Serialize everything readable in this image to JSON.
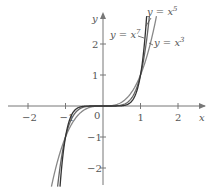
{
  "chart_data": {
    "type": "line",
    "title": "",
    "xlabel": "x",
    "ylabel": "y",
    "xlim": [
      -2.7,
      2.7
    ],
    "ylim": [
      -2.8,
      3.3
    ],
    "xticks": [
      -2,
      -1,
      1,
      2
    ],
    "yticks": [
      -2,
      -1,
      1,
      2
    ],
    "xtick_labels": [
      "−2",
      "−1",
      "1",
      "2"
    ],
    "ytick_labels": [
      "−2",
      "−1",
      "1",
      "2"
    ],
    "origin_label": "0",
    "grid": false,
    "legend": "inline annotations",
    "series": [
      {
        "name": "y = x^3",
        "label_base": "y = x",
        "exponent": "3",
        "power": 3,
        "color": "#888888"
      },
      {
        "name": "y = x^5",
        "label_base": "y = x",
        "exponent": "5",
        "power": 5,
        "color": "#666666"
      },
      {
        "name": "y = x^7",
        "label_base": "y = x",
        "exponent": "7",
        "power": 7,
        "color": "#333333"
      }
    ]
  }
}
